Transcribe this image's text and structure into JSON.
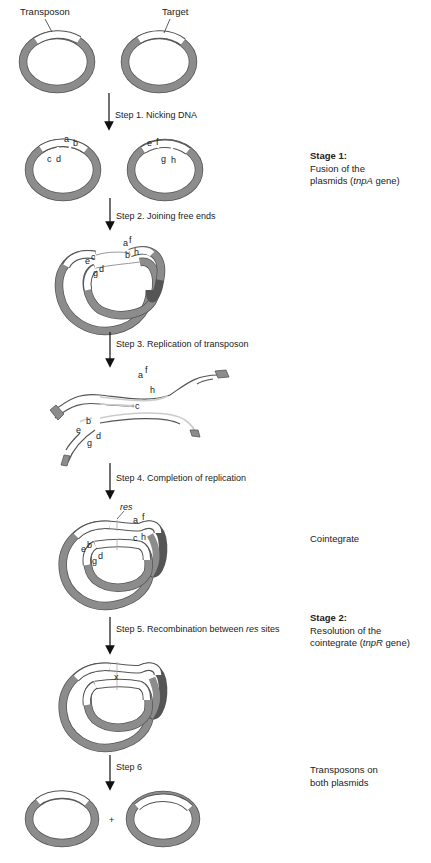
{
  "labels": {
    "transposon": "Transposon",
    "target": "Target"
  },
  "steps": [
    {
      "id": 1,
      "label": "Step 1. Nicking DNA"
    },
    {
      "id": 2,
      "label": "Step 2. Joining free ends"
    },
    {
      "id": 3,
      "label": "Step 3. Replication of transposon"
    },
    {
      "id": 4,
      "label": "Step 4. Completion of replication"
    },
    {
      "id": 5,
      "label_pre": "Step 5. Recombination between ",
      "label_italic": "res",
      "label_post": " sites"
    },
    {
      "id": 6,
      "label": "Step 6"
    }
  ],
  "side_notes": {
    "stage1": {
      "title": "Stage 1:",
      "line1": "Fusion of the",
      "line2_pre": "plasmids (",
      "line2_italic": "tnpA",
      "line2_post": " gene)"
    },
    "cointegrate": "Cointegrate",
    "stage2": {
      "title": "Stage 2:",
      "line1": "Resolution of the",
      "line2_pre": "cointegrate (",
      "line2_italic": "tnpR",
      "line2_post": " gene)"
    },
    "final": {
      "line1": "Transposons on",
      "line2": "both plasmids"
    }
  },
  "end_letters": {
    "a": "a",
    "b": "b",
    "c": "c",
    "d": "d",
    "e": "e",
    "f": "f",
    "g": "g",
    "h": "h"
  },
  "res_label": "res",
  "crossover_mark": "x",
  "plus_sign": "+",
  "colors": {
    "plasmid_gray": "#8c8c8c",
    "outline": "#555555",
    "transposon_white": "#ffffff",
    "text": "#222222"
  }
}
